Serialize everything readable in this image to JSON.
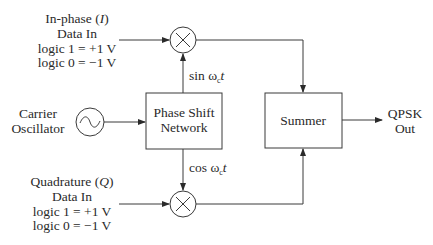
{
  "colors": {
    "line": "#3a3a3a",
    "text": "#2a2a2a",
    "background": "#ffffff"
  },
  "inputs": {
    "in_phase": {
      "name": "In-phase",
      "symbol": "I",
      "line2": "Data In",
      "line3": "logic 1 = +1 V",
      "line4": "logic 0 = −1 V"
    },
    "quadrature": {
      "name": "Quadrature",
      "symbol": "Q",
      "line2": "Data In",
      "line3": "logic 1 = +1 V",
      "line4": "logic 0 = −1 V"
    }
  },
  "oscillator": {
    "line1": "Carrier",
    "line2": "Oscillator",
    "icon": "sine-wave-icon"
  },
  "phase_shift": {
    "line1": "Phase Shift",
    "line2": "Network"
  },
  "signals": {
    "sin": {
      "func": "sin ",
      "omega": "ω",
      "sub": "c",
      "var": "t"
    },
    "cos": {
      "func": "cos ",
      "omega": "ω",
      "sub": "c",
      "var": "t"
    }
  },
  "mixers": [
    {
      "id": "mixer-i",
      "icon": "multiply-icon"
    },
    {
      "id": "mixer-q",
      "icon": "multiply-icon"
    }
  ],
  "summer": {
    "label": "Summer"
  },
  "output": {
    "line1": "QPSK",
    "line2": "Out"
  }
}
